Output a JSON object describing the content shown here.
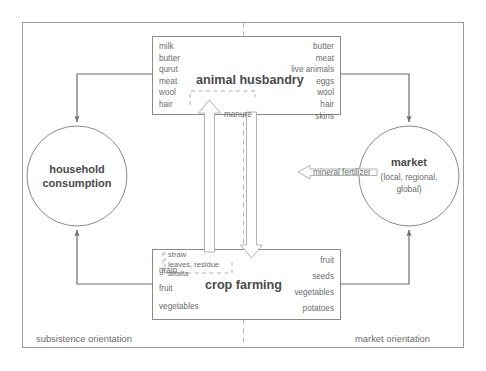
{
  "diagram": {
    "frame": {
      "border_color": "#9a9a9a"
    },
    "divider": {
      "name": "subsistence-market-divider",
      "style": "dashed",
      "color": "#b0b0b0"
    },
    "animal_husbandry": {
      "title": "animal husbandry",
      "subsistence_outputs": [
        "milk",
        "butter",
        "qurut",
        "meat",
        "wool",
        "hair"
      ],
      "market_outputs": [
        "butter",
        "meat",
        "live animals",
        "eggs",
        "wool",
        "hair",
        "skins"
      ]
    },
    "crop_farming": {
      "title": "crop farming",
      "subsistence_outputs": [
        "grain",
        "fruit",
        "vegetables"
      ],
      "market_outputs": [
        "fruit",
        "seeds",
        "vegetables",
        "potatoes"
      ],
      "fodder_inputs": [
        "straw",
        "leaves, residue",
        "alfalfa"
      ]
    },
    "household": {
      "line1": "household",
      "line2": "consumption"
    },
    "market": {
      "title": "market",
      "scope_line1": "(local, regional,",
      "scope_line2": "global)"
    },
    "flows": {
      "manure": "manure",
      "mineral_fertilizer": "mineral fertilizer"
    },
    "orientation": {
      "left": "subsistence orientation",
      "right": "market orientation"
    }
  }
}
